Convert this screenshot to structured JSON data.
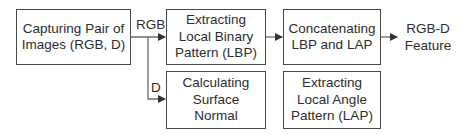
{
  "diagram": {
    "nodes": [
      {
        "id": "capture",
        "lines": [
          "Capturing Pair of",
          "Images (RGB, D)"
        ]
      },
      {
        "id": "lbp",
        "lines": [
          "Extracting",
          "Local Binary",
          "Pattern (LBP)"
        ]
      },
      {
        "id": "normal",
        "lines": [
          "Calculating",
          "Surface",
          "Normal"
        ]
      },
      {
        "id": "concat",
        "lines": [
          "Concatenating",
          "LBP and LAP"
        ]
      },
      {
        "id": "lap",
        "lines": [
          "Extracting",
          "Local Angle",
          "Pattern (LAP)"
        ]
      }
    ],
    "edge_labels": {
      "rgb": "RGB",
      "d": "D"
    },
    "output": {
      "lines": [
        "RGB-D",
        "Feature"
      ]
    },
    "edges": [
      {
        "from": "capture",
        "to": "lbp",
        "label": "RGB"
      },
      {
        "from": "capture",
        "to": "normal",
        "label": "D"
      },
      {
        "from": "lbp",
        "to": "concat"
      },
      {
        "from": "concat",
        "to": "output"
      }
    ],
    "colors": {
      "border": "#4a4a4a",
      "text": "#2d2d2d",
      "background": "#ffffff"
    }
  }
}
